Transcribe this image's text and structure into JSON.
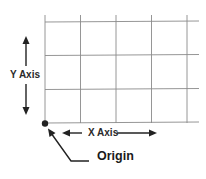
{
  "diagram": {
    "type": "coordinate-grid",
    "labels": {
      "y_axis": "Y Axis",
      "x_axis": "X Axis",
      "origin": "Origin"
    },
    "grid": {
      "columns": 4,
      "rows": 3,
      "line_color": "#8a8a8a"
    },
    "colors": {
      "text": "#2a2a2a",
      "arrows": "#222222",
      "origin_point": "#222222",
      "background": "#ffffff"
    }
  }
}
